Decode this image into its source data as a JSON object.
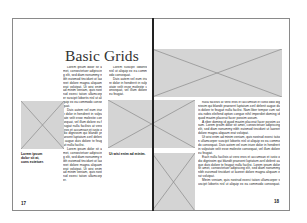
{
  "document": {
    "title": "Basic Grids",
    "pages": [
      {
        "side": "left",
        "page_number": "17",
        "caption_left": "Lorem ipsum dolor sit at, cons ectetuer.",
        "caption_right": "Ut wisi enim ad minim.",
        "column_1": [
          "Lorem ipsum dolor sit amet, consectetuer adipiscing elit, sed diam nonummy nibh euismod tincidunt ut laoreet dolore magna aliquam erat volutpat. Ut wisi enim ad minim veniam, quis nostrud exerci tation ullamcorper suscipit lobortis nisl ut aliquip ex ea commodo consequat.",
          "Duis autem vel eum iriure dolor in hendrerit in vulputate velit esse molestie consequat, vel illum dolore eu feugiat nulla facilisis at vero eros et accumsan et iusto odio dignissim qui blandit praesent luptatum zzril delenit augue duis dolore te feugait nulla facilisi.",
          "Lorem ipsum dolor sit amet, consectetuer adipiscing elit, sed diam nonummy nibh euismod tincidunt ut laoreet dolore magna aliquam erat volutpat. Ut wisi enim ad minim veniam, quis nostrud exerci tation ullamcorper."
        ],
        "column_2": [
          "Lorem suscipit lobortis nisl ut aliquip ex ea commodo consequat.",
          "Duis autem vel eum iriure dolor in hendrerit in vulputate velit esse molestie consequat, vel illum dolore eu feugiat."
        ]
      },
      {
        "side": "right",
        "page_number": "18",
        "body": [
          "nulla facilisis at vero eros et accumsan et iusto odio dignissim qui blandit praesent luptatum zzril delenit augue duis dolore te feugait nulla facilisi. Nam liber tempor cum soluta nobis eleifend option congue nihil imperdiet doming id quod mazim placerat facer possim assum.",
          "A riber doming id quod mazim placerat facer possim assum. Lorem ipsum dolor sit amet, consectetuer adipiscing elit, sed diam nonummy nibh euismod tincidunt ut laoreet dolore magna aliquam erat volutpat.",
          "Ut wisi enim ad minim veniam, quis nostrud exerci tation ullamcorper suscipit lobortis nisl ut aliquip ex ea commodo consequat. Duis autem vel eum iriure dolor in hendrerit in vulputate velit esse molestie consequat, vel illum dolore eu feugiat.",
          "Each nulla facilisis at vero eros et accumsan et iusto odio dignissim qui blandit praesent luptatum zzril delenit augue duis dolore te feugait nulla facilisi. Lorem ipsum dolor sit amet, consectetuer adipiscing elit, sed diam nonummy nibh euismod tincidunt ut laoreet dolore magna aliquam erat volutpat.",
          "Minim veniam, quis nostrud exerci tation ullamcorper suscipit lobortis nisl ut aliquip ex ea commodo consequat. Duis autem vel eum iriure dolor in hendrerit in vulputate velit esse."
        ]
      }
    ]
  },
  "colors": {
    "placeholder_fill": "#d4d4d4",
    "placeholder_lines": "#8a8a8a",
    "page_border": "#8a8a8a",
    "spine": "#222222"
  }
}
